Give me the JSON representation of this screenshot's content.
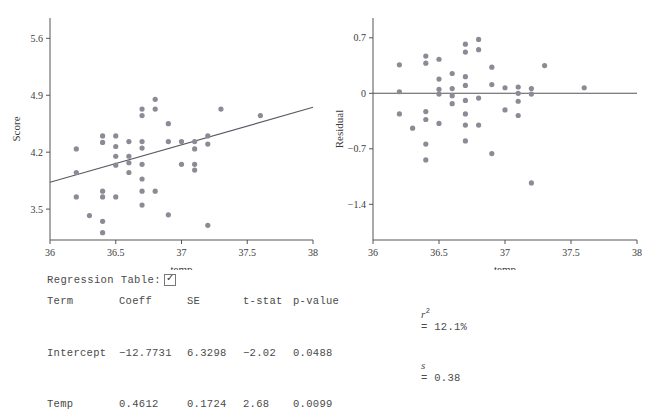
{
  "chart_data": [
    {
      "type": "scatter",
      "id": "score-vs-temp",
      "title": "",
      "xlabel": "temp",
      "ylabel": "Score",
      "xlim": [
        36,
        38
      ],
      "ylim": [
        3.12,
        5.85
      ],
      "xticks": [
        "36",
        "36.5",
        "37",
        "37.5",
        "38"
      ],
      "xtick_values": [
        36,
        36.5,
        37,
        37.5,
        38
      ],
      "yticks": [
        "5.6",
        "4.9",
        "4.2",
        "3.5"
      ],
      "ytick_values": [
        5.6,
        4.9,
        4.2,
        3.5
      ],
      "grid": false,
      "legend": "none",
      "fit_line": {
        "intercept": -12.7731,
        "slope": 0.4612,
        "color": "#5a5a66"
      },
      "points": [
        [
          36.2,
          4.24
        ],
        [
          36.2,
          3.95
        ],
        [
          36.2,
          3.65
        ],
        [
          36.3,
          3.42
        ],
        [
          36.4,
          4.4
        ],
        [
          36.4,
          4.32
        ],
        [
          36.4,
          3.72
        ],
        [
          36.4,
          3.65
        ],
        [
          36.4,
          3.35
        ],
        [
          36.4,
          3.21
        ],
        [
          36.5,
          4.4
        ],
        [
          36.5,
          4.27
        ],
        [
          36.5,
          4.15
        ],
        [
          36.5,
          4.04
        ],
        [
          36.5,
          3.65
        ],
        [
          36.6,
          4.33
        ],
        [
          36.6,
          4.15
        ],
        [
          36.6,
          4.07
        ],
        [
          36.6,
          3.95
        ],
        [
          36.7,
          4.73
        ],
        [
          36.7,
          4.65
        ],
        [
          36.7,
          4.33
        ],
        [
          36.7,
          4.25
        ],
        [
          36.7,
          4.05
        ],
        [
          36.7,
          3.87
        ],
        [
          36.7,
          3.72
        ],
        [
          36.7,
          3.55
        ],
        [
          36.8,
          4.85
        ],
        [
          36.8,
          4.73
        ],
        [
          36.8,
          3.72
        ],
        [
          36.9,
          4.55
        ],
        [
          36.9,
          4.33
        ],
        [
          36.9,
          3.43
        ],
        [
          37.0,
          4.33
        ],
        [
          37.0,
          4.05
        ],
        [
          37.1,
          4.33
        ],
        [
          37.1,
          4.24
        ],
        [
          37.1,
          4.05
        ],
        [
          37.1,
          3.98
        ],
        [
          37.2,
          4.4
        ],
        [
          37.2,
          4.3
        ],
        [
          37.2,
          3.3
        ],
        [
          37.3,
          4.73
        ],
        [
          37.6,
          4.65
        ]
      ]
    },
    {
      "type": "scatter",
      "id": "residual-vs-temp",
      "title": "",
      "xlabel": "temp",
      "ylabel": "Residual",
      "xlim": [
        36,
        38
      ],
      "ylim": [
        -1.85,
        0.95
      ],
      "xticks": [
        "36",
        "36.5",
        "37",
        "37.5",
        "38"
      ],
      "xtick_values": [
        36,
        36.5,
        37,
        37.5,
        38
      ],
      "yticks": [
        "0.7",
        "0",
        "−0.7",
        "−1.4"
      ],
      "ytick_values": [
        0.7,
        0,
        -0.7,
        -1.4
      ],
      "grid": false,
      "legend": "none",
      "reference_line": {
        "y": 0,
        "color": "#555"
      },
      "points": [
        [
          36.2,
          0.36
        ],
        [
          36.2,
          0.02
        ],
        [
          36.2,
          -0.26
        ],
        [
          36.3,
          -0.44
        ],
        [
          36.4,
          0.47
        ],
        [
          36.4,
          0.38
        ],
        [
          36.4,
          -0.23
        ],
        [
          36.4,
          -0.33
        ],
        [
          36.4,
          -0.64
        ],
        [
          36.4,
          -0.84
        ],
        [
          36.5,
          0.43
        ],
        [
          36.5,
          0.18
        ],
        [
          36.5,
          0.05
        ],
        [
          36.5,
          -0.01
        ],
        [
          36.5,
          -0.38
        ],
        [
          36.6,
          0.25
        ],
        [
          36.6,
          0.06
        ],
        [
          36.6,
          -0.03
        ],
        [
          36.6,
          -0.13
        ],
        [
          36.7,
          0.62
        ],
        [
          36.7,
          0.52
        ],
        [
          36.7,
          0.21
        ],
        [
          36.7,
          0.1
        ],
        [
          36.7,
          -0.09
        ],
        [
          36.7,
          -0.26
        ],
        [
          36.7,
          -0.4
        ],
        [
          36.7,
          -0.6
        ],
        [
          36.8,
          0.68
        ],
        [
          36.8,
          0.55
        ],
        [
          36.8,
          -0.06
        ],
        [
          36.8,
          -0.4
        ],
        [
          36.9,
          0.33
        ],
        [
          36.9,
          0.11
        ],
        [
          36.9,
          -0.76
        ],
        [
          37.0,
          0.07
        ],
        [
          37.0,
          -0.21
        ],
        [
          37.1,
          0.08
        ],
        [
          37.1,
          0.0
        ],
        [
          37.1,
          -0.1
        ],
        [
          37.1,
          -0.28
        ],
        [
          37.2,
          0.06
        ],
        [
          37.2,
          -0.01
        ],
        [
          37.2,
          -1.13
        ],
        [
          37.3,
          0.35
        ],
        [
          37.6,
          0.07
        ]
      ]
    }
  ],
  "controls": {
    "regression_table_label": "Regression Table:",
    "regression_table_checked": true,
    "checkmark_glyph": "✓"
  },
  "regression_table": {
    "headers": [
      "Term",
      "Coeff",
      "SE",
      "t-stat",
      "p-value"
    ],
    "rows": [
      {
        "term": "Intercept",
        "coeff": "−12.7731",
        "se": "6.3298",
        "t": "−2.02",
        "p": "0.0488"
      },
      {
        "term": "Temp",
        "coeff": "0.4612",
        "se": "0.1724",
        "t": "2.68",
        "p": "0.0099"
      }
    ],
    "stats": {
      "r2_label": "r",
      "r2_sup": "2",
      "r2_value": "= 12.1%",
      "s_label": "s",
      "s_value": "= 0.38"
    }
  },
  "colors": {
    "point": "#8b8b95",
    "fit_line": "#5a5a66",
    "axis": "#555555",
    "text": "#3a3a3a"
  }
}
